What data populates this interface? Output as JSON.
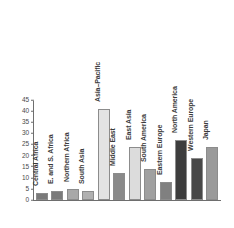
{
  "chart_data": {
    "type": "bar",
    "title": "",
    "xlabel": "",
    "ylabel": "",
    "ylim": [
      0,
      45
    ],
    "grid": false,
    "legend": "none",
    "y_ticks": [
      "0",
      "5",
      "10",
      "15",
      "20",
      "25",
      "30",
      "35",
      "40",
      "45"
    ],
    "y_tick_values": [
      0,
      5,
      10,
      15,
      20,
      25,
      30,
      35,
      40,
      45
    ],
    "categories": [
      "Central Africa",
      "E. and S. Africa",
      "Northern Africa",
      "South Asia",
      "Asia–Pacific",
      "Middle East",
      "East Asia",
      "South America",
      "Eastern Europe",
      "North America",
      "Western Europe",
      "Japan"
    ],
    "values": [
      3,
      4,
      5,
      4,
      41,
      12,
      24,
      14,
      8,
      27,
      19,
      24
    ],
    "bar_colors": [
      "#7a7a7a",
      "#7a7a7a",
      "#a8a8a8",
      "#b0b0b0",
      "#e3e3e3",
      "#8a8a8a",
      "#dcdcdc",
      "#a0a0a0",
      "#808080",
      "#3d3d3d",
      "#484848",
      "#9a9a9a"
    ]
  },
  "style": {
    "axis_color": "#6e6e6e",
    "tick_text_color": "#4a4a4a",
    "label_text_color": "#3b3b3b",
    "background": "#ffffff",
    "bar_border": "#8c8c8c"
  }
}
